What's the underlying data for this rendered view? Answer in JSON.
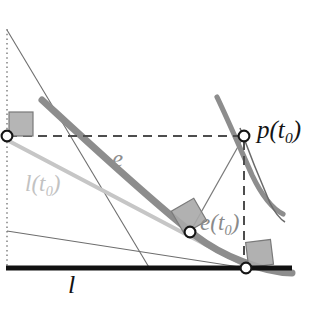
{
  "figure": {
    "background_color": "#ffffff",
    "width": 325,
    "height": 319
  },
  "labels": {
    "point_p": {
      "base": "p",
      "open": "(",
      "arg": "t",
      "sub": "0",
      "close": ")",
      "color": "#141414"
    },
    "curve_e": {
      "base": "e",
      "color": "#8e8e8e"
    },
    "point_e_t0": {
      "base": "e",
      "open": "(",
      "arg": "t",
      "sub": "0",
      "close": ")",
      "color": "#8a8a8a"
    },
    "line_l_t0": {
      "base": "l",
      "open": "(",
      "arg": "t",
      "sub": "0",
      "close": ")",
      "color": "#c2c2c2"
    },
    "line_l": {
      "base": "l",
      "color": "#121212"
    }
  },
  "colors": {
    "thick_curve": "#8d8d8d",
    "light_gray_line": "#c6c6c6",
    "thin_line": "#707070",
    "black_line": "#111111",
    "dashed_line": "#555555",
    "dotted_line": "#8a8a8a",
    "right_angle_fill": "#a8a8a8",
    "right_angle_stroke": "#7a7a7a",
    "marker_fill": "#ffffff",
    "marker_stroke": "#161616"
  },
  "geometry": {
    "markers": [
      {
        "name": "p-t0-marker",
        "x": 244,
        "y": 136,
        "r": 5.5
      },
      {
        "name": "e-t0-marker",
        "x": 190,
        "y": 232,
        "r": 5.5
      },
      {
        "name": "base-left-marker",
        "x": 7,
        "y": 136,
        "r": 5.5
      },
      {
        "name": "base-right-marker",
        "x": 246,
        "y": 268,
        "r": 5.5
      }
    ],
    "dotted_vertical": {
      "x": 7,
      "y1": 29,
      "y2": 268
    },
    "dashed_horizontal": {
      "y": 136,
      "x1": 7,
      "x2": 244
    },
    "dashed_vertical": {
      "x": 244,
      "y1": 136,
      "y2": 257
    },
    "base_black_line": {
      "x1": 6,
      "y1": 268,
      "x2": 290,
      "y2": 268
    },
    "thick_evolute_path": "M 42 100 C 95 148, 165 215, 215 250 C 240 266, 270 272, 290 272",
    "thick_p_curve_path": "M 218 98 C 228 118, 240 145, 252 172 C 262 192, 272 205, 282 212",
    "thin_p_branch_path": "M 244 136 C 254 160, 264 185, 272 206",
    "light_gray_tangent": {
      "x1": 7,
      "y1": 140,
      "x2": 246,
      "y2": 267
    },
    "thin_steep_line": {
      "x1": 7,
      "y1": 30,
      "x2": 150,
      "y2": 268
    },
    "thin_normal_line": {
      "x1": 190,
      "y1": 232,
      "x2": 244,
      "y2": 136
    },
    "thin_shallow_line": {
      "x1": 7,
      "y1": 231,
      "x2": 246,
      "y2": 268
    },
    "right_angles": [
      {
        "name": "right-angle-origin",
        "x": 9,
        "y": 112,
        "size": 24,
        "rotation": 0
      },
      {
        "name": "right-angle-e-t0",
        "x": 176,
        "y": 204,
        "size": 26,
        "rotation": -31
      },
      {
        "name": "right-angle-base-right",
        "x": 248,
        "y": 241,
        "size": 25,
        "rotation": -8
      }
    ]
  }
}
